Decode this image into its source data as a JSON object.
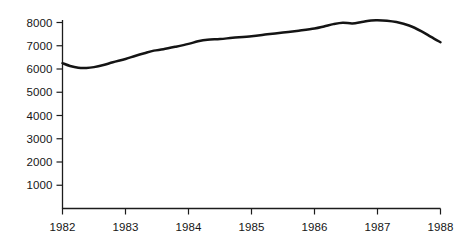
{
  "chart_data": {
    "type": "line",
    "title": "",
    "subtitle": "",
    "xlabel": "",
    "ylabel": "",
    "xlim": [
      1982,
      1988
    ],
    "ylim": [
      0,
      8400
    ],
    "grid": false,
    "legend": null,
    "x_tick_labels": [
      "1982",
      "1983",
      "1984",
      "1985",
      "1986",
      "1987",
      "1988"
    ],
    "x_ticks": [
      1982,
      1983,
      1984,
      1985,
      1986,
      1987,
      1988
    ],
    "y_tick_labels": [
      "1000",
      "2000",
      "3000",
      "4000",
      "5000",
      "6000",
      "7000",
      "8000"
    ],
    "y_ticks": [
      1000,
      2000,
      3000,
      4000,
      5000,
      6000,
      7000,
      8000
    ],
    "series": [
      {
        "name": "series-1",
        "color": "#141414",
        "x": [
          1982.0,
          1982.12,
          1982.25,
          1982.38,
          1982.5,
          1982.65,
          1982.8,
          1983.0,
          1983.15,
          1983.3,
          1983.45,
          1983.6,
          1983.8,
          1984.0,
          1984.15,
          1984.3,
          1984.5,
          1984.7,
          1985.0,
          1985.25,
          1985.5,
          1985.75,
          1986.0,
          1986.15,
          1986.3,
          1986.45,
          1986.6,
          1986.75,
          1986.9,
          1987.0,
          1987.15,
          1987.3,
          1987.5,
          1987.7,
          1987.85,
          1988.0
        ],
        "y": [
          6250,
          6130,
          6055,
          6045,
          6080,
          6170,
          6290,
          6430,
          6560,
          6680,
          6790,
          6850,
          6960,
          7080,
          7190,
          7260,
          7290,
          7340,
          7410,
          7490,
          7570,
          7650,
          7740,
          7830,
          7930,
          7990,
          7960,
          8020,
          8090,
          8100,
          8080,
          8020,
          7870,
          7620,
          7380,
          7150
        ]
      }
    ]
  },
  "axes": {
    "y_axis_name": "y-axis",
    "x_axis_name": "x-axis"
  }
}
